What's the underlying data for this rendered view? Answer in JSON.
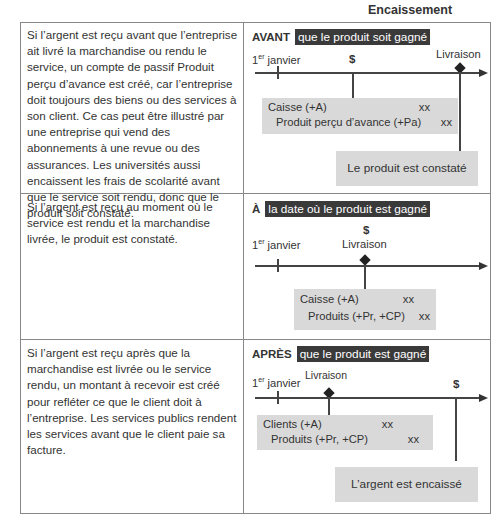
{
  "header": {
    "cut_off_text": "l'argent est reçu",
    "column_title": "Encaissement"
  },
  "rows": [
    {
      "description": "Si l’argent est reçu avant que l’entreprise ait livré la marchandise ou rendu le service, un compte de passif Produit perçu d’avance est créé, car l’entreprise doit toujours des biens ou des services à son client. Ce cas peut être illustré par une entreprise qui vend des abonnements à une revue ou des assurances. Les universités aussi encaissent les frais de scolarité avant que le service soit rendu, donc que le produit soit constaté.",
      "keyword": "AVANT",
      "highlight": "que le produit soit gagné",
      "timeline": {
        "start": "1er janvier",
        "start_sup": "er",
        "start_base": "1",
        "start_rest": " janvier",
        "cash_symbol": "$",
        "delivery": "Livraison"
      },
      "entry": [
        {
          "account": "Caisse (+A)",
          "amount": "xx"
        },
        {
          "account": "Produit perçu d’avance (+Pa)",
          "amount": "xx"
        }
      ],
      "result": "Le produit est constaté"
    },
    {
      "description": "Si l’argent est reçu au moment où le service est rendu et la marchandise livrée, le produit est constaté.",
      "keyword": "À",
      "highlight": "la date où le produit est gagné",
      "timeline": {
        "start_base": "1",
        "start_sup": "er",
        "start_rest": " janvier",
        "cash_symbol": "$",
        "delivery": "Livraison"
      },
      "entry": [
        {
          "account": "Caisse (+A)",
          "amount": "xx"
        },
        {
          "account": "Produits (+Pr, +CP)",
          "amount": "xx"
        }
      ]
    },
    {
      "description": "Si l’argent est reçu après que la marchandise est livrée ou le service rendu, un montant à recevoir est créé pour refléter ce que le client doit à l’entreprise. Les services publics rendent les services avant que le client paie sa facture.",
      "keyword": "APRÈS",
      "highlight": "que le produit est gagné",
      "timeline": {
        "start_base": "1",
        "start_sup": "er",
        "start_rest": " janvier",
        "cash_symbol": "$",
        "delivery": "Livraison"
      },
      "entry": [
        {
          "account": "Clients (+A)",
          "amount": "xx"
        },
        {
          "account": "Produits (+Pr, +CP)",
          "amount": "xx"
        }
      ],
      "result": "L’argent est encaissé"
    }
  ]
}
